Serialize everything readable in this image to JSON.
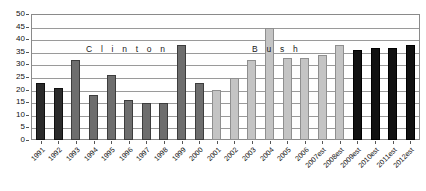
{
  "chart_data": {
    "type": "bar",
    "title": "",
    "subtitle": "",
    "xlabel": "",
    "ylabel": "",
    "ylim": [
      0,
      50
    ],
    "ytick_step": 5,
    "yticks": [
      "50",
      "45",
      "40",
      "35",
      "30",
      "25",
      "20",
      "15",
      "10",
      "5",
      "0"
    ],
    "grid": true,
    "legend": "none",
    "categories": [
      "1991",
      "1992",
      "1993",
      "1994",
      "1995",
      "1996",
      "1997",
      "1998",
      "1999",
      "2000",
      "2001",
      "2002",
      "2003",
      "2004",
      "2005",
      "2006",
      "2007est",
      "2008est",
      "2009est",
      "2010est",
      "2011est",
      "2012est"
    ],
    "values": [
      23,
      21,
      32,
      18,
      26,
      16,
      15,
      15,
      38,
      23,
      20,
      25,
      32,
      45,
      33,
      33,
      34,
      38,
      36,
      37,
      37,
      38
    ],
    "bar_styles": [
      "c-dark",
      "c-dark",
      "c-mid",
      "c-mid",
      "c-mid",
      "c-mid",
      "c-mid",
      "c-mid",
      "c-mid",
      "c-mid",
      "c-light",
      "c-light",
      "c-light",
      "c-light",
      "c-light",
      "c-light",
      "c-light",
      "c-light",
      "c-black",
      "c-black",
      "c-black",
      "c-black"
    ],
    "annotations": [
      {
        "text": "C l i n t o n",
        "name": "era-label-clinton"
      },
      {
        "text": "B u s h",
        "name": "era-label-bush"
      }
    ],
    "colors": {
      "dark": "#2b2b2b",
      "mid": "#6e6e6e",
      "light": "#c4c4c4",
      "black": "#111111",
      "grid": "#9a9a9a",
      "frame": "#8a8a8a",
      "text": "#141414",
      "background": "#ffffff"
    }
  }
}
